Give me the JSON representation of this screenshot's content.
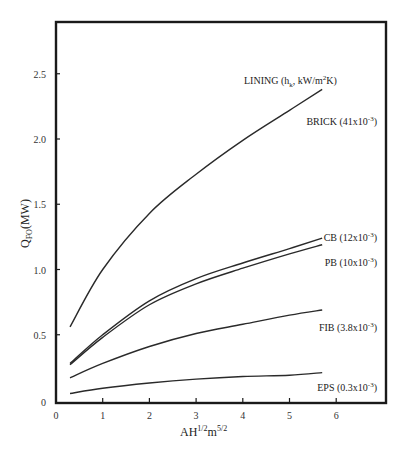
{
  "chart_data": {
    "type": "line",
    "title": "",
    "xlabel": "AH^1/2 m^5/2",
    "xlabel_parts": {
      "base": "AH",
      "sup1": "1/2",
      "mid": "m",
      "sup2": "5/2"
    },
    "ylabel": "Q_FO (MW)",
    "ylabel_parts": {
      "base": "Q",
      "sub": "FO",
      "rest": "(MW)"
    },
    "xlim": [
      0,
      7
    ],
    "ylim": [
      0,
      2.9
    ],
    "xticks": [
      0,
      1,
      2,
      3,
      4,
      5,
      6
    ],
    "yticks": [
      0,
      0.5,
      1.0,
      1.5,
      2.0,
      2.5
    ],
    "ytick_labels": [
      "0",
      "0.5",
      "1.0",
      "1.5",
      "2.0",
      "2.5"
    ],
    "grid": false,
    "legend_header": "LINING (h_k, kW/m²K)",
    "legend_header_parts": {
      "pre": "LINING (h",
      "sub": "k",
      "mid": ", kW/m",
      "sup": "2",
      "post": "K)"
    },
    "x": [
      0.3,
      1,
      2,
      3,
      4,
      5,
      5.7
    ],
    "series": [
      {
        "name": "BRICK",
        "label": "BRICK (41x10",
        "exp": "-3",
        "values": [
          0.56,
          1.0,
          1.43,
          1.73,
          1.99,
          2.22,
          2.38
        ]
      },
      {
        "name": "CB",
        "label": "CB (12x10",
        "exp": "-3",
        "values": [
          0.28,
          0.5,
          0.76,
          0.93,
          1.05,
          1.16,
          1.24
        ]
      },
      {
        "name": "PB",
        "label": "PB (10x10",
        "exp": "-3",
        "values": [
          0.27,
          0.48,
          0.73,
          0.89,
          1.01,
          1.12,
          1.19
        ]
      },
      {
        "name": "FIB",
        "label": "FIB (3.8x10",
        "exp": "-3",
        "values": [
          0.17,
          0.28,
          0.41,
          0.51,
          0.58,
          0.65,
          0.69
        ]
      },
      {
        "name": "EPS",
        "label": "EPS (0.3x10",
        "exp": "-3",
        "values": [
          0.05,
          0.09,
          0.13,
          0.16,
          0.18,
          0.19,
          0.21
        ]
      }
    ],
    "label_positions": {
      "BRICK": 2.14,
      "CB": 1.25,
      "PB": 1.06,
      "FIB": 0.56,
      "EPS": 0.1
    },
    "colors": {
      "line": "#2a2a2a",
      "frame": "#1a1a1a"
    }
  }
}
